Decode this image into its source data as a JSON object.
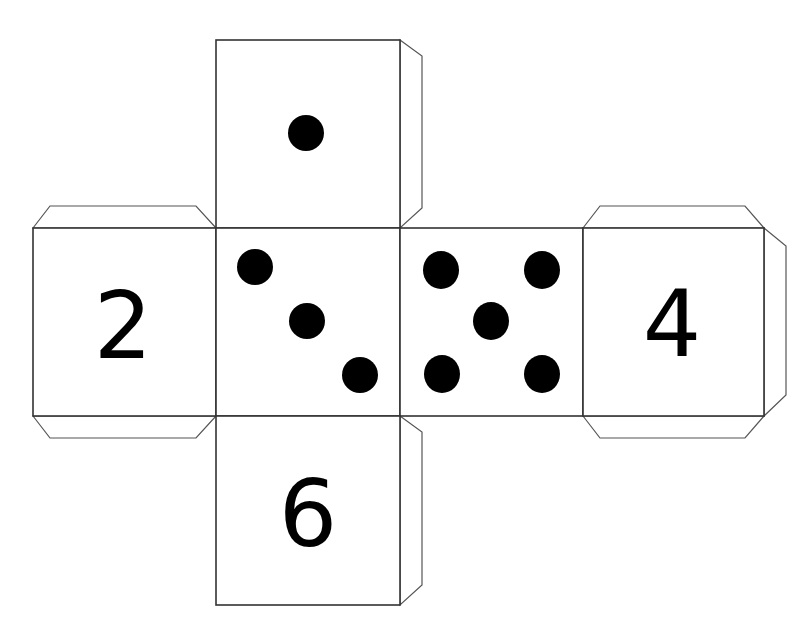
{
  "colors": {
    "pip": "#000000",
    "outline": "#333333",
    "background": "#ffffff"
  },
  "faces": [
    {
      "id": "top",
      "type": "pips",
      "value": 1,
      "label": "1"
    },
    {
      "id": "left",
      "type": "numeral",
      "value": 2,
      "label": "2"
    },
    {
      "id": "center-left",
      "type": "pips",
      "value": 3,
      "label": "3"
    },
    {
      "id": "center-right",
      "type": "pips",
      "value": 5,
      "label": "5"
    },
    {
      "id": "right",
      "type": "numeral",
      "value": 4,
      "label": "4"
    },
    {
      "id": "bottom",
      "type": "numeral",
      "value": 6,
      "label": "6"
    }
  ],
  "tabs": [
    "top-face-right-tab",
    "left-face-top-tab",
    "left-face-bottom-tab",
    "right-face-top-tab",
    "right-face-bottom-tab",
    "right-face-right-tab",
    "bottom-face-right-tab"
  ]
}
